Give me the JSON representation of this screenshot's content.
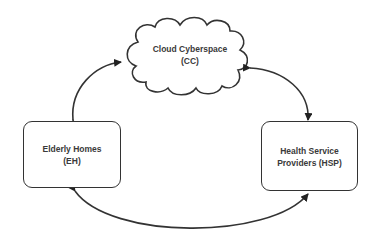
{
  "diagram": {
    "type": "block-diagram",
    "nodes": [
      {
        "id": "CC",
        "shape": "cloud",
        "line1": "Cloud Cyberspace",
        "line2": "(CC)"
      },
      {
        "id": "EH",
        "shape": "rounded-rect",
        "line1": "Elderly Homes",
        "line2": "(EH)"
      },
      {
        "id": "HSP",
        "shape": "rounded-rect",
        "line1": "Health Service",
        "line2": "Providers (HSP)"
      }
    ],
    "edges": [
      {
        "from": "EH",
        "to": "CC",
        "direction": "bidirectional"
      },
      {
        "from": "CC",
        "to": "HSP",
        "direction": "bidirectional"
      },
      {
        "from": "EH",
        "to": "HSP",
        "direction": "bidirectional"
      }
    ],
    "colors": {
      "stroke": "#333333",
      "text": "#3a3a3a",
      "background": "#ffffff"
    }
  }
}
